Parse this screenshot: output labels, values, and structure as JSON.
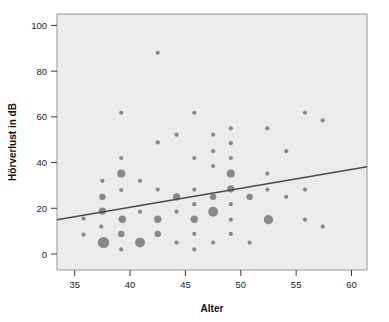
{
  "chart_data": {
    "type": "scatter",
    "title": "",
    "subtitle": "",
    "xlabel": "Alter",
    "ylabel": "Hörverlust in dB",
    "xlim": [
      33.4,
      61.4
    ],
    "ylim": [
      -7,
      105
    ],
    "xticks": [
      35,
      40,
      45,
      50,
      55,
      60
    ],
    "yticks": [
      0,
      20,
      40,
      60,
      80,
      100
    ],
    "grid": false,
    "legend": null,
    "marker_color": "#7f7f7f",
    "plot_background": "#ececec",
    "plot_border_color": "#9a9a9a",
    "axis_color": "#3b3b3b",
    "trendline": {
      "type": "line",
      "color": "#4b4b4b",
      "width": 1.4,
      "x_start": 33.4,
      "y_start": 15.0,
      "x_end": 61.4,
      "y_end": 38.2
    },
    "size_note": "marker area encodes count of observations at that coordinate",
    "points": [
      {
        "x": 35.8,
        "y": 15.5,
        "size": 1
      },
      {
        "x": 35.8,
        "y": 8.5,
        "size": 1
      },
      {
        "x": 37.5,
        "y": 32.0,
        "size": 1
      },
      {
        "x": 37.5,
        "y": 25.0,
        "size": 3
      },
      {
        "x": 37.5,
        "y": 18.8,
        "size": 4
      },
      {
        "x": 37.4,
        "y": 12.0,
        "size": 1
      },
      {
        "x": 37.6,
        "y": 5.0,
        "size": 11
      },
      {
        "x": 39.2,
        "y": 61.8,
        "size": 1
      },
      {
        "x": 39.2,
        "y": 42.0,
        "size": 1
      },
      {
        "x": 39.2,
        "y": 35.2,
        "size": 5
      },
      {
        "x": 39.2,
        "y": 28.0,
        "size": 1
      },
      {
        "x": 39.3,
        "y": 15.2,
        "size": 4
      },
      {
        "x": 39.2,
        "y": 8.8,
        "size": 3
      },
      {
        "x": 39.2,
        "y": 2.0,
        "size": 1
      },
      {
        "x": 40.9,
        "y": 32.0,
        "size": 1
      },
      {
        "x": 40.9,
        "y": 18.5,
        "size": 1
      },
      {
        "x": 40.9,
        "y": 5.0,
        "size": 8
      },
      {
        "x": 42.5,
        "y": 88.0,
        "size": 1
      },
      {
        "x": 42.5,
        "y": 48.8,
        "size": 1
      },
      {
        "x": 42.5,
        "y": 28.2,
        "size": 1
      },
      {
        "x": 42.5,
        "y": 15.2,
        "size": 4
      },
      {
        "x": 42.5,
        "y": 8.8,
        "size": 3
      },
      {
        "x": 44.2,
        "y": 52.2,
        "size": 1
      },
      {
        "x": 44.2,
        "y": 25.0,
        "size": 4
      },
      {
        "x": 44.2,
        "y": 18.5,
        "size": 1
      },
      {
        "x": 44.2,
        "y": 5.0,
        "size": 1
      },
      {
        "x": 45.8,
        "y": 61.8,
        "size": 1
      },
      {
        "x": 45.8,
        "y": 42.0,
        "size": 1
      },
      {
        "x": 45.8,
        "y": 28.2,
        "size": 1
      },
      {
        "x": 45.8,
        "y": 21.8,
        "size": 1
      },
      {
        "x": 45.8,
        "y": 15.2,
        "size": 4
      },
      {
        "x": 45.8,
        "y": 8.8,
        "size": 1
      },
      {
        "x": 45.8,
        "y": 2.0,
        "size": 1
      },
      {
        "x": 47.5,
        "y": 52.2,
        "size": 1
      },
      {
        "x": 47.5,
        "y": 45.0,
        "size": 1
      },
      {
        "x": 47.5,
        "y": 38.5,
        "size": 1
      },
      {
        "x": 47.5,
        "y": 25.0,
        "size": 3
      },
      {
        "x": 47.5,
        "y": 18.5,
        "size": 8
      },
      {
        "x": 47.5,
        "y": 5.0,
        "size": 1
      },
      {
        "x": 49.1,
        "y": 55.0,
        "size": 1
      },
      {
        "x": 49.1,
        "y": 48.5,
        "size": 1
      },
      {
        "x": 49.1,
        "y": 42.0,
        "size": 1
      },
      {
        "x": 49.1,
        "y": 35.2,
        "size": 5
      },
      {
        "x": 49.1,
        "y": 28.5,
        "size": 4
      },
      {
        "x": 49.1,
        "y": 21.8,
        "size": 1
      },
      {
        "x": 49.1,
        "y": 15.0,
        "size": 1
      },
      {
        "x": 49.1,
        "y": 8.8,
        "size": 1
      },
      {
        "x": 50.8,
        "y": 25.0,
        "size": 3
      },
      {
        "x": 50.8,
        "y": 5.0,
        "size": 1
      },
      {
        "x": 52.4,
        "y": 55.0,
        "size": 1
      },
      {
        "x": 52.4,
        "y": 35.2,
        "size": 1
      },
      {
        "x": 52.4,
        "y": 28.2,
        "size": 1
      },
      {
        "x": 52.5,
        "y": 15.0,
        "size": 7
      },
      {
        "x": 54.1,
        "y": 45.0,
        "size": 1
      },
      {
        "x": 54.1,
        "y": 25.0,
        "size": 1
      },
      {
        "x": 55.8,
        "y": 61.8,
        "size": 1
      },
      {
        "x": 55.8,
        "y": 28.2,
        "size": 1
      },
      {
        "x": 55.8,
        "y": 15.0,
        "size": 1
      },
      {
        "x": 57.4,
        "y": 58.5,
        "size": 1
      },
      {
        "x": 57.4,
        "y": 12.0,
        "size": 1
      }
    ]
  }
}
